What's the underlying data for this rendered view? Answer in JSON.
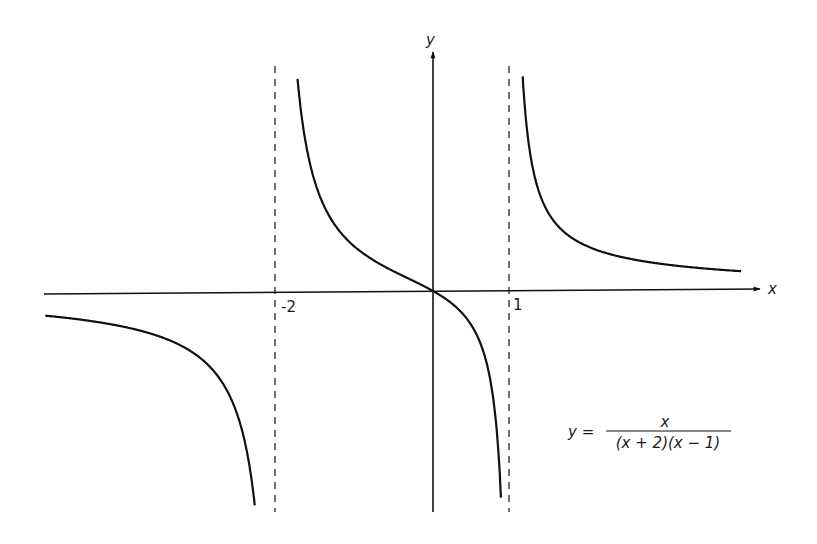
{
  "chart_data": {
    "type": "line",
    "title": "",
    "function": "y = x / ((x + 2)(x - 1))",
    "xlabel": "x",
    "ylabel": "y",
    "tick_labels": [
      {
        "x": -2,
        "label": "-2"
      },
      {
        "x": 1,
        "label": "1"
      }
    ],
    "vertical_asymptotes": [
      -2,
      1
    ],
    "horizontal_asymptote": 0,
    "grid": false,
    "legend": null,
    "x_range": [
      -5.0,
      3.9
    ],
    "annotation": {
      "lhs": "y =",
      "numerator": "x",
      "denominator": "(x + 2)(x − 1)"
    },
    "series": [
      {
        "name": "branch x < -2",
        "x": [
          -5.0,
          -4.0,
          -3.0,
          -2.5,
          -2.2,
          -2.1
        ],
        "y": [
          -0.28,
          -0.4,
          -0.75,
          -1.43,
          -3.44,
          -6.77
        ]
      },
      {
        "name": "branch -2 < x < 1",
        "x": [
          -1.88,
          -1.5,
          -1.0,
          -0.5,
          0.0,
          0.5,
          0.8,
          0.9
        ],
        "y": [
          2.7,
          0.86,
          0.5,
          0.22,
          0.0,
          -0.4,
          -1.43,
          -3.1
        ]
      },
      {
        "name": "branch x > 1",
        "x": [
          1.12,
          1.5,
          2.0,
          3.0,
          3.9
        ],
        "y": [
          2.7,
          1.71,
          1.0,
          0.6,
          0.23
        ]
      }
    ]
  },
  "labels": {
    "x_axis": "x",
    "y_axis": "y",
    "tick_neg2": "-2",
    "tick_1": "1",
    "eq_lhs": "y =",
    "eq_num": "x",
    "eq_den": "(x + 2)(x − 1)"
  }
}
